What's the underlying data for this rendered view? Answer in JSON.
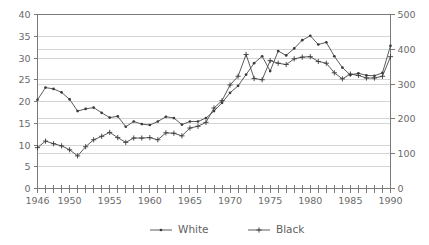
{
  "chart_data": {
    "type": "line",
    "title": "",
    "subtitle": "",
    "xlabel": "",
    "ylabel": "",
    "ylabel_right": "",
    "x": [
      1946,
      1947,
      1948,
      1949,
      1950,
      1951,
      1952,
      1953,
      1954,
      1955,
      1956,
      1957,
      1958,
      1959,
      1960,
      1961,
      1962,
      1963,
      1964,
      1965,
      1966,
      1967,
      1968,
      1969,
      1970,
      1971,
      1972,
      1973,
      1974,
      1975,
      1976,
      1977,
      1978,
      1979,
      1980,
      1981,
      1982,
      1983,
      1984,
      1985,
      1986,
      1987,
      1988,
      1989,
      1990
    ],
    "xlim": [
      1946,
      1990
    ],
    "ylim": [
      0,
      40
    ],
    "ylim_right": [
      0,
      500
    ],
    "yticks": [
      0,
      5,
      10,
      15,
      20,
      25,
      30,
      35,
      40
    ],
    "yticks_right": [
      0,
      100,
      200,
      300,
      400,
      500
    ],
    "xticks_labeled": [
      1946,
      1950,
      1955,
      1960,
      1965,
      1970,
      1975,
      1980,
      1985,
      1990
    ],
    "xtick_every": 1,
    "grid": true,
    "grid_axis": "y",
    "legend_position": "bottom",
    "series": [
      {
        "name": "White",
        "marker": "dot",
        "axis": "left",
        "values": [
          20.4,
          23.2,
          22.9,
          22.1,
          20.5,
          17.8,
          18.3,
          18.6,
          17.4,
          16.3,
          16.6,
          14.2,
          15.4,
          14.8,
          14.6,
          15.4,
          16.5,
          16.2,
          14.7,
          15.4,
          15.4,
          16.2,
          17.8,
          19.7,
          22.0,
          23.6,
          26.2,
          28.8,
          30.4,
          27.0,
          31.6,
          30.6,
          32.2,
          34.1,
          35.1,
          33.1,
          33.6,
          30.4,
          27.8,
          26.1,
          26.5,
          26.0,
          25.9,
          26.6,
          32.8
        ]
      },
      {
        "name": "Black",
        "marker": "plus",
        "axis": "left",
        "values": [
          9.4,
          10.9,
          10.3,
          9.8,
          8.9,
          7.5,
          9.6,
          11.2,
          12.0,
          12.9,
          11.7,
          10.6,
          11.6,
          11.6,
          11.7,
          11.2,
          12.8,
          12.7,
          12.1,
          13.9,
          14.3,
          15.2,
          18.5,
          20.2,
          23.8,
          25.8,
          30.8,
          25.3,
          25.0,
          29.4,
          28.8,
          28.5,
          29.8,
          30.2,
          30.3,
          29.2,
          28.8,
          26.6,
          25.2,
          26.3,
          26.0,
          25.4,
          25.4,
          25.8,
          30.3
        ]
      }
    ]
  },
  "legend": {
    "items": [
      {
        "label": "White",
        "marker": "dot"
      },
      {
        "label": "Black",
        "marker": "plus"
      }
    ]
  },
  "axes": {
    "left_ticks": [
      "0",
      "5",
      "10",
      "15",
      "20",
      "25",
      "30",
      "35",
      "40"
    ],
    "right_ticks": [
      "0",
      "100",
      "200",
      "300",
      "400",
      "500"
    ],
    "x_ticks": [
      "1946",
      "1950",
      "1955",
      "1960",
      "1965",
      "1970",
      "1975",
      "1980",
      "1985",
      "1990"
    ]
  },
  "colors": {
    "background": "#ffffff",
    "axis": "#7a7a7a",
    "grid": "#c9c9c9",
    "series": "#3a3a3a",
    "text": "#6b6b6b"
  }
}
